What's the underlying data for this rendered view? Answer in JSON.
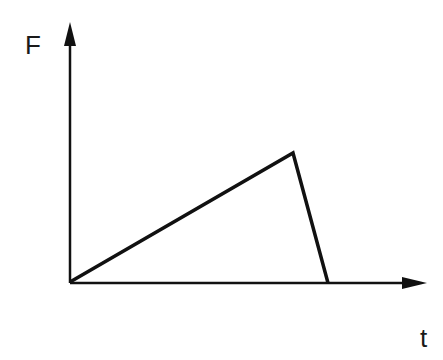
{
  "diagram": {
    "title": "",
    "y_axis_label": "F",
    "x_axis_label": "t",
    "line_color": "#111111",
    "points": [
      {
        "name": "origin",
        "x": 70,
        "y": 282
      },
      {
        "name": "peak",
        "x": 293,
        "y": 153
      },
      {
        "name": "end",
        "x": 328,
        "y": 283
      }
    ]
  }
}
